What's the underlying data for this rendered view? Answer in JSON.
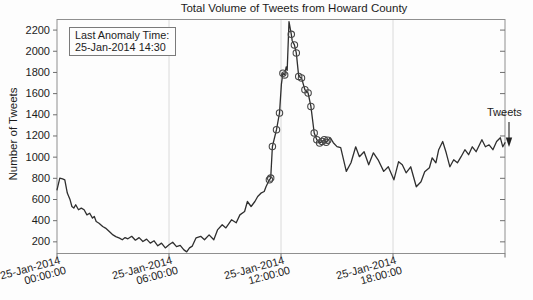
{
  "figure": {
    "title": "Total Volume of Tweets from Howard County",
    "y_axis_label": "Number of Tweets",
    "series_label": "Tweets",
    "annotation": {
      "line1": "Last Anomaly Time:",
      "line2": "25-Jan-2014 14:30"
    }
  },
  "chart_data": {
    "type": "line",
    "title": "Total Volume of Tweets from Howard County",
    "xlabel": "",
    "ylabel": "Number of Tweets",
    "x_axis_unit": "hours since 25-Jan-2014 00:00:00",
    "xlim": [
      0,
      24
    ],
    "ylim": [
      90,
      2300
    ],
    "y_ticks": [
      200,
      400,
      600,
      800,
      1000,
      1200,
      1400,
      1600,
      1800,
      2000,
      2200
    ],
    "x_ticks": [
      {
        "hours": 0,
        "line1": "25-Jan-2014",
        "line2": "00:00:00"
      },
      {
        "hours": 6,
        "line1": "25-Jan-2014",
        "line2": "06:00:00"
      },
      {
        "hours": 12,
        "line1": "25-Jan-2014",
        "line2": "12:00:00"
      },
      {
        "hours": 18,
        "line1": "25-Jan-2014",
        "line2": "18:00:00"
      },
      {
        "hours": 24,
        "line1": "",
        "line2": ""
      }
    ],
    "grid_x_hours": [
      6,
      12,
      18
    ],
    "grid_y": false,
    "legend_position": "right-of-plot-inline",
    "colors": {
      "line": "#2f2f2f",
      "marker": "#474747",
      "frame": "#8f8f8f",
      "grid": "#d6d6d6",
      "tick": "#6e6e6e"
    },
    "series": [
      {
        "name": "Tweets",
        "color": "#2f2f2f",
        "points": [
          [
            0,
            692
          ],
          [
            0.15,
            802
          ],
          [
            0.3,
            795
          ],
          [
            0.42,
            785
          ],
          [
            0.55,
            660
          ],
          [
            0.7,
            597
          ],
          [
            0.8,
            534
          ],
          [
            0.9,
            519
          ],
          [
            1.0,
            550
          ],
          [
            1.15,
            503
          ],
          [
            1.3,
            519
          ],
          [
            1.45,
            503
          ],
          [
            1.6,
            455
          ],
          [
            1.75,
            471
          ],
          [
            1.9,
            424
          ],
          [
            2.0,
            439
          ],
          [
            2.1,
            392
          ],
          [
            2.25,
            376
          ],
          [
            2.45,
            345
          ],
          [
            2.6,
            330
          ],
          [
            2.8,
            297
          ],
          [
            3.0,
            266
          ],
          [
            3.15,
            250
          ],
          [
            3.35,
            235
          ],
          [
            3.5,
            219
          ],
          [
            3.65,
            240
          ],
          [
            3.8,
            229
          ],
          [
            4.0,
            252
          ],
          [
            4.2,
            216
          ],
          [
            4.4,
            240
          ],
          [
            4.6,
            203
          ],
          [
            4.8,
            226
          ],
          [
            5.0,
            188
          ],
          [
            5.2,
            210
          ],
          [
            5.4,
            163
          ],
          [
            5.6,
            188
          ],
          [
            5.8,
            143
          ],
          [
            6.0,
            172
          ],
          [
            6.2,
            196
          ],
          [
            6.4,
            155
          ],
          [
            6.6,
            167
          ],
          [
            6.8,
            124
          ],
          [
            6.95,
            105
          ],
          [
            7.1,
            143
          ],
          [
            7.25,
            160
          ],
          [
            7.45,
            238
          ],
          [
            7.7,
            252
          ],
          [
            7.9,
            219
          ],
          [
            8.15,
            266
          ],
          [
            8.4,
            219
          ],
          [
            8.6,
            313
          ],
          [
            8.85,
            361
          ],
          [
            9.05,
            332
          ],
          [
            9.35,
            408
          ],
          [
            9.6,
            380
          ],
          [
            9.8,
            455
          ],
          [
            10.05,
            487
          ],
          [
            10.2,
            581
          ],
          [
            10.4,
            534
          ],
          [
            10.6,
            581
          ],
          [
            10.75,
            628
          ],
          [
            10.95,
            663
          ],
          [
            11.1,
            676
          ],
          [
            11.2,
            723
          ],
          [
            11.38,
            786
          ],
          [
            11.45,
            802
          ],
          [
            11.54,
            1101
          ],
          [
            11.76,
            1259
          ],
          [
            11.92,
            1417
          ],
          [
            12.02,
            1690
          ],
          [
            12.1,
            1793
          ],
          [
            12.2,
            1777
          ],
          [
            12.28,
            1852
          ],
          [
            12.33,
            1820
          ],
          [
            12.43,
            2280
          ],
          [
            12.55,
            2160
          ],
          [
            12.6,
            2100
          ],
          [
            12.72,
            2060
          ],
          [
            12.82,
            1985
          ],
          [
            12.95,
            1763
          ],
          [
            13.1,
            1748
          ],
          [
            13.28,
            1637
          ],
          [
            13.45,
            1606
          ],
          [
            13.6,
            1479
          ],
          [
            13.78,
            1228
          ],
          [
            13.92,
            1165
          ],
          [
            14.07,
            1133
          ],
          [
            14.2,
            1149
          ],
          [
            14.32,
            1165
          ],
          [
            14.42,
            1140
          ],
          [
            14.5,
            1160
          ],
          [
            14.65,
            1181
          ],
          [
            14.8,
            1136
          ],
          [
            15.0,
            1100
          ],
          [
            15.2,
            1089
          ],
          [
            15.5,
            865
          ],
          [
            15.75,
            947
          ],
          [
            16.0,
            1098
          ],
          [
            16.2,
            1004
          ],
          [
            16.45,
            1051
          ],
          [
            16.7,
            928
          ],
          [
            16.95,
            1041
          ],
          [
            17.2,
            975
          ],
          [
            17.5,
            865
          ],
          [
            17.75,
            909
          ],
          [
            18.05,
            786
          ],
          [
            18.3,
            957
          ],
          [
            18.5,
            928
          ],
          [
            18.7,
            852
          ],
          [
            18.95,
            909
          ],
          [
            19.25,
            720
          ],
          [
            19.5,
            767
          ],
          [
            19.7,
            862
          ],
          [
            19.95,
            900
          ],
          [
            20.1,
            994
          ],
          [
            20.3,
            947
          ],
          [
            20.45,
            1070
          ],
          [
            20.66,
            1148
          ],
          [
            20.85,
            1041
          ],
          [
            21.05,
            909
          ],
          [
            21.25,
            975
          ],
          [
            21.45,
            947
          ],
          [
            21.65,
            1004
          ],
          [
            21.85,
            1070
          ],
          [
            22.05,
            1023
          ],
          [
            22.25,
            1098
          ],
          [
            22.45,
            1051
          ],
          [
            22.76,
            1165
          ],
          [
            22.95,
            1098
          ],
          [
            23.15,
            1117
          ],
          [
            23.35,
            1070
          ],
          [
            23.55,
            1148
          ],
          [
            23.75,
            1184
          ],
          [
            23.88,
            1098
          ],
          [
            24.0,
            1136
          ]
        ]
      }
    ],
    "anomalies": {
      "marker": "circle",
      "color": "#474747",
      "last_anomaly_time": "25-Jan-2014 14:30",
      "points": [
        [
          11.38,
          786
        ],
        [
          11.45,
          802
        ],
        [
          11.54,
          1101
        ],
        [
          11.76,
          1259
        ],
        [
          11.92,
          1417
        ],
        [
          12.1,
          1793
        ],
        [
          12.2,
          1777
        ],
        [
          12.55,
          2160
        ],
        [
          12.72,
          2060
        ],
        [
          12.82,
          1985
        ],
        [
          12.95,
          1763
        ],
        [
          13.1,
          1748
        ],
        [
          13.28,
          1637
        ],
        [
          13.45,
          1606
        ],
        [
          13.6,
          1479
        ],
        [
          13.78,
          1228
        ],
        [
          13.92,
          1165
        ],
        [
          14.07,
          1133
        ],
        [
          14.2,
          1149
        ],
        [
          14.32,
          1165
        ],
        [
          14.42,
          1140
        ],
        [
          14.5,
          1160
        ]
      ]
    }
  }
}
